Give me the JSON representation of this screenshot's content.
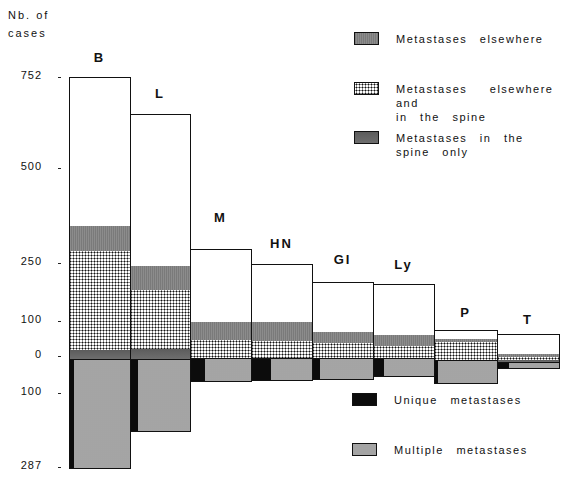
{
  "chart_data": {
    "type": "bar",
    "subtype": "stacked, diverging (above and below zero baseline)",
    "ylabel": "Nb. of cases",
    "ylabel_lines": [
      "Nb. of",
      "cases"
    ],
    "y_ticks_above": [
      "752",
      "500",
      "250",
      "100",
      "0"
    ],
    "y_ticks_below": [
      "100",
      "287"
    ],
    "categories": [
      "B",
      "L",
      "M",
      "HN",
      "GI",
      "Ly",
      "P",
      "T"
    ],
    "series_above": [
      {
        "name": "Spine only (thin band at base)",
        "key": "spine",
        "values": [
          13,
          18,
          0,
          0,
          0,
          0,
          0,
          3
        ]
      },
      {
        "name": "Metastases elsewhere and in the spine",
        "key": "both",
        "values": [
          267,
          177,
          50,
          48,
          40,
          34,
          55,
          8
        ]
      },
      {
        "name": "Metastases in the spine only",
        "key": "spine_upper",
        "values": [
          70,
          63,
          40,
          45,
          28,
          30,
          5,
          5
        ]
      },
      {
        "name": "No spinal involvement (white)",
        "key": "white",
        "values": [
          402,
          397,
          190,
          145,
          135,
          151,
          22,
          64
        ]
      }
    ],
    "totals_above": [
      752,
      655,
      280,
      238,
      203,
      215,
      82,
      80
    ],
    "series_below": [
      {
        "name": "Unique metastases",
        "values": [
          10,
          22,
          25,
          30,
          15,
          15,
          5,
          20
        ]
      },
      {
        "name": "Multiple metastases",
        "values": [
          277,
          165,
          30,
          25,
          30,
          20,
          50,
          12
        ]
      }
    ],
    "totals_below": [
      287,
      187,
      55,
      55,
      45,
      35,
      55,
      32
    ],
    "legend": [
      {
        "label": "Metastases elsewhere",
        "pattern": "fine grey"
      },
      {
        "label": "Metastases elsewhere and in the spine",
        "pattern": "checkered"
      },
      {
        "label": "Metastases in the spine only",
        "pattern": "dark grey"
      },
      {
        "label": "Unique metastases",
        "pattern": "black"
      },
      {
        "label": "Multiple metastases",
        "pattern": "light stipple"
      }
    ],
    "grid": false
  },
  "axis": {
    "title_line1": "Nb. of",
    "title_line2": "cases",
    "ticks": [
      {
        "label": "752",
        "y": 77
      },
      {
        "label": "500",
        "y": 168
      },
      {
        "label": "250",
        "y": 263
      },
      {
        "label": "100",
        "y": 321
      },
      {
        "label": "0",
        "y": 356
      },
      {
        "label": "100",
        "y": 393
      },
      {
        "label": "287",
        "y": 467
      }
    ]
  },
  "bars": [
    {
      "cat": "B",
      "x": 69,
      "w": 61,
      "label_y": 50,
      "segs": [
        {
          "p": "white",
          "t": 77,
          "b": 226
        },
        {
          "p": "elsewhere",
          "t": 226,
          "b": 251
        },
        {
          "p": "both",
          "t": 251,
          "b": 350
        },
        {
          "p": "spine",
          "t": 350,
          "b": 359
        }
      ],
      "below": [
        {
          "p": "unique",
          "t": 359,
          "b": 468,
          "l": 0,
          "w": 5
        },
        {
          "p": "multiple",
          "t": 359,
          "b": 468,
          "l": 5,
          "w": 56
        }
      ]
    },
    {
      "cat": "L",
      "x": 130,
      "w": 60,
      "label_y": 86,
      "segs": [
        {
          "p": "white",
          "t": 114,
          "b": 266
        },
        {
          "p": "elsewhere",
          "t": 266,
          "b": 290
        },
        {
          "p": "both",
          "t": 290,
          "b": 349
        },
        {
          "p": "spine",
          "t": 349,
          "b": 359
        }
      ],
      "below": [
        {
          "p": "unique",
          "t": 359,
          "b": 431,
          "l": 0,
          "w": 8
        },
        {
          "p": "multiple",
          "t": 359,
          "b": 431,
          "l": 8,
          "w": 52
        }
      ]
    },
    {
      "cat": "M",
      "x": 190,
      "w": 61,
      "label_y": 210,
      "segs": [
        {
          "p": "white",
          "t": 249,
          "b": 322
        },
        {
          "p": "elsewhere",
          "t": 322,
          "b": 340
        },
        {
          "p": "both",
          "t": 340,
          "b": 358
        }
      ],
      "below": [
        {
          "p": "unique",
          "t": 358,
          "b": 381,
          "l": 0,
          "w": 15
        },
        {
          "p": "multiple",
          "t": 358,
          "b": 381,
          "l": 15,
          "w": 46
        }
      ]
    },
    {
      "cat": "HN",
      "x": 251,
      "w": 61,
      "label_y": 236,
      "segs": [
        {
          "p": "white",
          "t": 264,
          "b": 322
        },
        {
          "p": "elsewhere",
          "t": 322,
          "b": 341
        },
        {
          "p": "both",
          "t": 341,
          "b": 358
        }
      ],
      "below": [
        {
          "p": "unique",
          "t": 358,
          "b": 380,
          "l": 0,
          "w": 20
        },
        {
          "p": "multiple",
          "t": 358,
          "b": 380,
          "l": 20,
          "w": 41
        }
      ]
    },
    {
      "cat": "GI",
      "x": 312,
      "w": 61,
      "label_y": 252,
      "segs": [
        {
          "p": "white",
          "t": 282,
          "b": 332
        },
        {
          "p": "elsewhere",
          "t": 332,
          "b": 343
        },
        {
          "p": "both",
          "t": 343,
          "b": 358
        }
      ],
      "below": [
        {
          "p": "unique",
          "t": 358,
          "b": 379,
          "l": 0,
          "w": 8
        },
        {
          "p": "multiple",
          "t": 358,
          "b": 379,
          "l": 8,
          "w": 53
        }
      ]
    },
    {
      "cat": "Ly",
      "x": 373,
      "w": 61,
      "label_y": 257,
      "segs": [
        {
          "p": "white",
          "t": 284,
          "b": 335
        },
        {
          "p": "elsewhere",
          "t": 335,
          "b": 346
        },
        {
          "p": "both",
          "t": 346,
          "b": 358
        }
      ],
      "below": [
        {
          "p": "unique",
          "t": 358,
          "b": 376,
          "l": 0,
          "w": 11
        },
        {
          "p": "multiple",
          "t": 358,
          "b": 376,
          "l": 11,
          "w": 50
        }
      ]
    },
    {
      "cat": "P",
      "x": 434,
      "w": 63,
      "label_y": 305,
      "segs": [
        {
          "p": "white",
          "t": 330,
          "b": 339
        },
        {
          "p": "elsewhere",
          "t": 339,
          "b": 342
        },
        {
          "p": "both",
          "t": 342,
          "b": 360
        }
      ],
      "below": [
        {
          "p": "unique",
          "t": 360,
          "b": 383,
          "l": 0,
          "w": 4
        },
        {
          "p": "multiple",
          "t": 360,
          "b": 383,
          "l": 4,
          "w": 59
        }
      ]
    },
    {
      "cat": "T",
      "x": 497,
      "w": 62,
      "label_y": 312,
      "segs": [
        {
          "p": "white",
          "t": 334,
          "b": 354
        },
        {
          "p": "elsewhere",
          "t": 354,
          "b": 357
        },
        {
          "p": "both",
          "t": 357,
          "b": 360
        },
        {
          "p": "spine",
          "t": 360,
          "b": 362
        }
      ],
      "below": [
        {
          "p": "unique",
          "t": 362,
          "b": 368,
          "l": 0,
          "w": 12
        },
        {
          "p": "multiple",
          "t": 362,
          "b": 368,
          "l": 12,
          "w": 50
        }
      ]
    }
  ],
  "legend_top": [
    {
      "pattern": "elsewhere",
      "x": 354,
      "y": 32,
      "lines": [
        "Metastases elsewhere"
      ]
    },
    {
      "pattern": "both",
      "x": 354,
      "y": 82,
      "lines": [
        "Metastases elsewhere and",
        "in the spine"
      ]
    },
    {
      "pattern": "spine",
      "x": 354,
      "y": 131,
      "lines": [
        "Metastases in the",
        "spine only"
      ]
    }
  ],
  "legend_bottom": [
    {
      "pattern": "unique",
      "x": 352,
      "y": 393,
      "lines": [
        "Unique metastases"
      ]
    },
    {
      "pattern": "multiple",
      "x": 352,
      "y": 443,
      "lines": [
        "Multiple metastases"
      ]
    }
  ]
}
